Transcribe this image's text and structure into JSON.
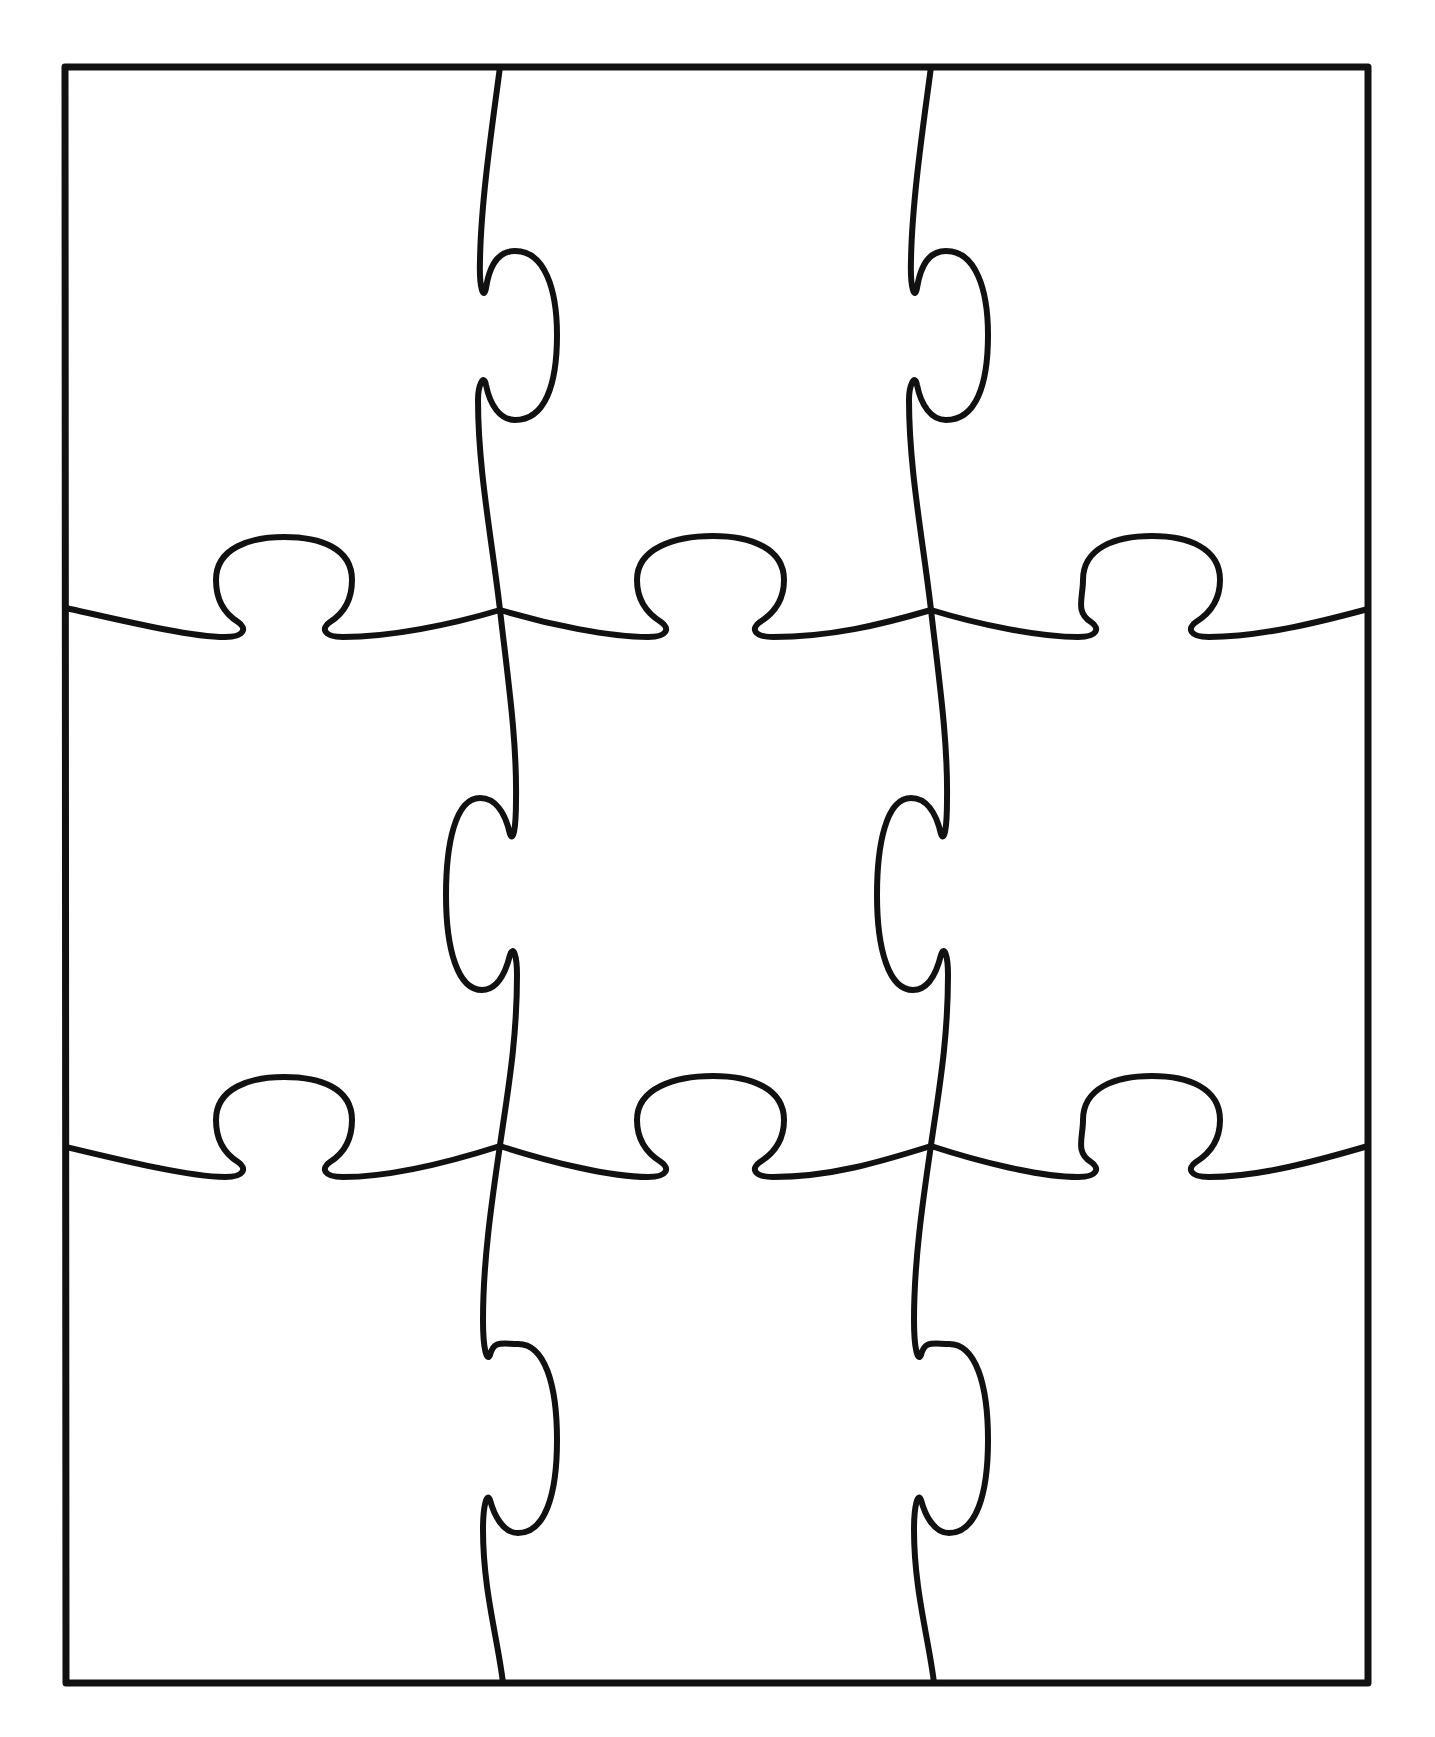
{
  "diagram": {
    "type": "jigsaw-puzzle-template",
    "rows": 3,
    "columns": 3,
    "piece_count": 9,
    "colors": {
      "background": "#ffffff",
      "line": "#111111"
    },
    "frame": {
      "x": 65,
      "y": 67,
      "width": 1303,
      "height": 1616,
      "stroke_width": 7
    },
    "cut_stroke_width": 6,
    "pieces": [
      {
        "row": 1,
        "col": 1
      },
      {
        "row": 1,
        "col": 2
      },
      {
        "row": 1,
        "col": 3
      },
      {
        "row": 2,
        "col": 1
      },
      {
        "row": 2,
        "col": 2
      },
      {
        "row": 2,
        "col": 3
      },
      {
        "row": 3,
        "col": 1
      },
      {
        "row": 3,
        "col": 2
      },
      {
        "row": 3,
        "col": 3
      }
    ]
  }
}
